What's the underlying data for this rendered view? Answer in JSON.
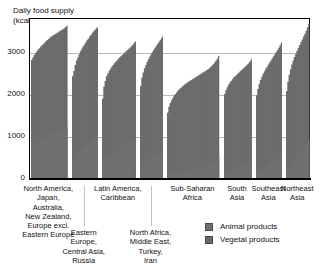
{
  "chart_data": {
    "type": "area",
    "title": "Daily food supply (kcal/capita)",
    "title_line1": "Daily food supply",
    "title_line2": "(kcal/capita)",
    "xlabel": "",
    "ylabel": "Daily food supply (kcal/capita)",
    "ylim": [
      0,
      3800
    ],
    "yticks": [
      0,
      1000,
      2000,
      3000
    ],
    "ytick_labels": [
      "0",
      "1000",
      "2000",
      "3000"
    ],
    "grid": true,
    "legend_position": "bottom-right",
    "legend": [
      {
        "name": "Animal products",
        "color": "#6e6e6e"
      },
      {
        "name": "Vegetal products",
        "color": "#6a6a6a"
      }
    ],
    "note": "Stacked area/bar of per-country daily food supply, countries sorted ascending within each region group.",
    "categories": [
      "North America, Japan, Australia, New Zealand, Europe excl. Eastern Europe",
      "Eastern Europe, Central Asia, Russia",
      "Latin America, Caribbean",
      "North Africa, Middle East, Turkey, Iran",
      "Sub-Saharan Africa",
      "South Asia",
      "Southeast Asia",
      "Northeast Asia"
    ],
    "groups": [
      {
        "label_lines": [
          "North America,",
          "Japan,",
          "Australia,",
          "New Zealand,",
          "Europe excl.",
          "Eastern Europe"
        ],
        "label": "North America, Japan, Australia, New Zealand, Europe excl. Eastern Europe",
        "n_countries": 28,
        "total_values": [
          2820,
          2880,
          2940,
          2990,
          3030,
          3070,
          3100,
          3140,
          3170,
          3200,
          3240,
          3270,
          3300,
          3320,
          3350,
          3380,
          3400,
          3420,
          3440,
          3460,
          3480,
          3500,
          3520,
          3540,
          3560,
          3580,
          3610,
          3640
        ],
        "animal_values": [
          760,
          790,
          820,
          840,
          860,
          880,
          900,
          920,
          940,
          960,
          980,
          1000,
          1010,
          1030,
          1040,
          1060,
          1070,
          1090,
          1100,
          1110,
          1120,
          1140,
          1150,
          1160,
          1170,
          1180,
          1200,
          1220
        ]
      },
      {
        "label_lines": [
          "Eastern Europe,",
          "Central Asia,",
          "Russia"
        ],
        "label": "Eastern Europe, Central Asia, Russia",
        "n_countries": 20,
        "total_values": [
          2430,
          2560,
          2700,
          2800,
          2880,
          2960,
          3030,
          3090,
          3140,
          3190,
          3240,
          3290,
          3330,
          3380,
          3420,
          3460,
          3500,
          3540,
          3570,
          3600
        ],
        "animal_values": [
          480,
          520,
          560,
          600,
          630,
          660,
          690,
          710,
          740,
          760,
          780,
          800,
          820,
          840,
          860,
          880,
          900,
          920,
          940,
          960
        ]
      },
      {
        "label_lines": [
          "Latin America,",
          "Caribbean"
        ],
        "label": "Latin America, Caribbean",
        "n_countries": 26,
        "total_values": [
          1900,
          2180,
          2320,
          2430,
          2500,
          2560,
          2610,
          2660,
          2700,
          2740,
          2780,
          2810,
          2850,
          2880,
          2910,
          2940,
          2970,
          3000,
          3030,
          3060,
          3090,
          3120,
          3150,
          3180,
          3220,
          3260
        ],
        "animal_values": [
          340,
          420,
          460,
          500,
          530,
          560,
          580,
          600,
          620,
          640,
          660,
          680,
          700,
          720,
          740,
          760,
          780,
          800,
          820,
          840,
          860,
          880,
          900,
          920,
          940,
          960
        ]
      },
      {
        "label_lines": [
          "North Africa,",
          "Middle East,",
          "Turkey,",
          "Iran"
        ],
        "label": "North Africa, Middle East, Turkey, Iran",
        "n_countries": 18,
        "total_values": [
          2190,
          2400,
          2520,
          2620,
          2700,
          2780,
          2840,
          2900,
          2960,
          3010,
          3060,
          3110,
          3160,
          3200,
          3250,
          3290,
          3340,
          3400
        ],
        "animal_values": [
          260,
          300,
          330,
          360,
          390,
          410,
          440,
          460,
          480,
          500,
          520,
          540,
          560,
          580,
          600,
          620,
          640,
          670
        ]
      },
      {
        "label_lines": [
          "Sub-Saharan",
          "Africa"
        ],
        "label": "Sub-Saharan Africa",
        "n_countries": 40,
        "total_values": [
          1560,
          1700,
          1790,
          1860,
          1920,
          1970,
          2010,
          2050,
          2090,
          2120,
          2150,
          2180,
          2210,
          2230,
          2260,
          2280,
          2300,
          2320,
          2340,
          2360,
          2380,
          2400,
          2420,
          2440,
          2460,
          2480,
          2500,
          2520,
          2540,
          2560,
          2580,
          2600,
          2630,
          2660,
          2690,
          2720,
          2760,
          2800,
          2850,
          2920
        ],
        "animal_values": [
          90,
          100,
          110,
          120,
          125,
          130,
          135,
          140,
          145,
          150,
          155,
          160,
          165,
          170,
          175,
          180,
          185,
          190,
          195,
          200,
          205,
          210,
          215,
          220,
          230,
          240,
          250,
          260,
          270,
          280,
          290,
          300,
          315,
          330,
          350,
          370,
          400,
          430,
          470,
          520
        ]
      },
      {
        "label_lines": [
          "South",
          "Asia"
        ],
        "label": "South Asia",
        "n_countries": 22,
        "total_values": [
          2010,
          2100,
          2170,
          2230,
          2280,
          2320,
          2360,
          2400,
          2430,
          2460,
          2490,
          2520,
          2550,
          2580,
          2610,
          2640,
          2670,
          2700,
          2730,
          2770,
          2810,
          2870
        ],
        "animal_values": [
          130,
          150,
          165,
          180,
          190,
          200,
          210,
          220,
          230,
          240,
          250,
          260,
          270,
          280,
          290,
          300,
          310,
          325,
          340,
          360,
          380,
          410
        ]
      },
      {
        "label_lines": [
          "Southeast",
          "Asia"
        ],
        "label": "Southeast Asia",
        "n_countries": 20,
        "total_values": [
          1980,
          2130,
          2250,
          2340,
          2420,
          2490,
          2550,
          2610,
          2660,
          2710,
          2760,
          2810,
          2860,
          2910,
          2960,
          3010,
          3060,
          3110,
          3170,
          3240
        ],
        "animal_values": [
          140,
          165,
          190,
          210,
          230,
          250,
          270,
          290,
          310,
          330,
          350,
          370,
          390,
          410,
          430,
          450,
          470,
          500,
          530,
          570
        ]
      },
      {
        "label_lines": [
          "Northeast",
          "Asia"
        ],
        "label": "Northeast Asia",
        "n_countries": 18,
        "total_values": [
          2080,
          2300,
          2470,
          2600,
          2710,
          2800,
          2890,
          2970,
          3040,
          3110,
          3180,
          3250,
          3310,
          3380,
          3450,
          3520,
          3600,
          3680
        ],
        "animal_values": [
          170,
          210,
          250,
          290,
          330,
          370,
          410,
          450,
          490,
          530,
          570,
          610,
          650,
          700,
          750,
          800,
          860,
          920
        ]
      }
    ]
  }
}
